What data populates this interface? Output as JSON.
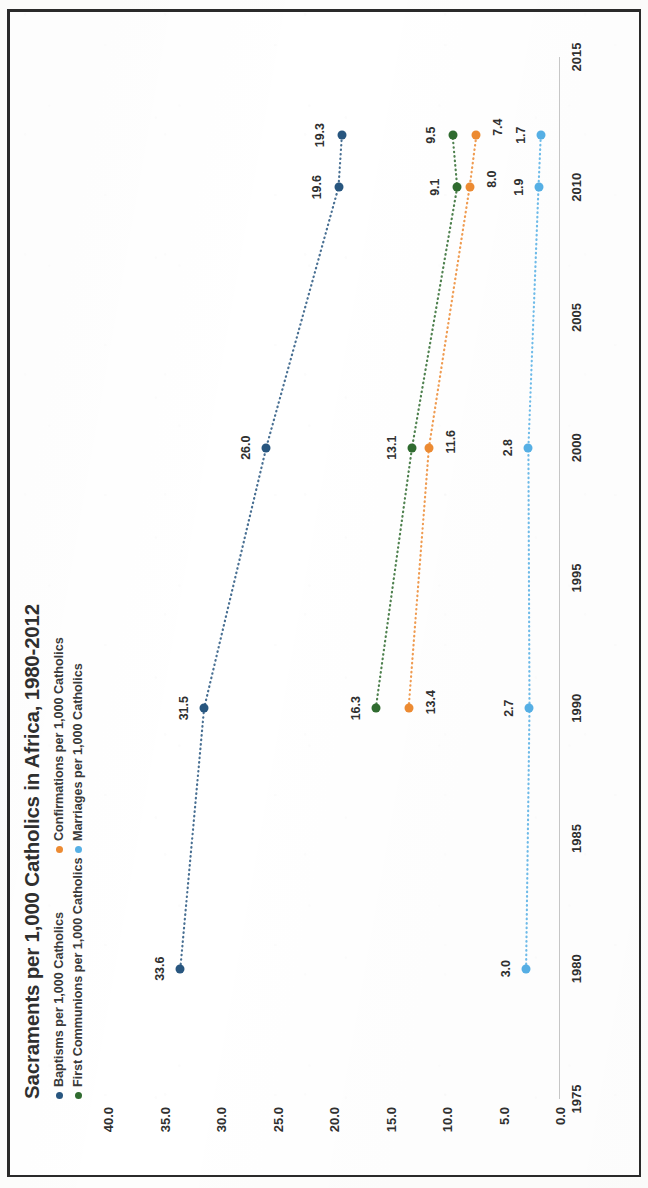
{
  "figure": {
    "title": "Sacraments per 1,000 Catholics in Africa, 1980-2012"
  },
  "legend": [
    {
      "label": "Baptisms per 1,000 Catholics",
      "color": "#28567f",
      "key": "baptisms"
    },
    {
      "label": "First Communions per 1,000 Catholics",
      "color": "#2f6b2f",
      "key": "first_communions"
    },
    {
      "label": "Confirmations per 1,000 Catholics",
      "color": "#ed8b32",
      "key": "confirmations"
    },
    {
      "label": "Marriages per 1,000 Catholics",
      "color": "#56b0e6",
      "key": "marriages"
    }
  ],
  "chart_data": {
    "type": "line",
    "title": "Sacraments per 1,000 Catholics in Africa, 1980-2012",
    "xlabel": "",
    "ylabel": "",
    "x": [
      1980,
      1990,
      2000,
      2010,
      2012
    ],
    "xlim": [
      1975,
      2015
    ],
    "ylim": [
      0.0,
      40.0
    ],
    "xticks": [
      "1975",
      "1980",
      "1985",
      "1990",
      "1995",
      "2000",
      "2005",
      "2010",
      "2015"
    ],
    "xtick_values": [
      1975,
      1980,
      1985,
      1990,
      1995,
      2000,
      2005,
      2010,
      2015
    ],
    "yticks": [
      "0.0",
      "5.0",
      "10.0",
      "15.0",
      "20.0",
      "25.0",
      "30.0",
      "35.0",
      "40.0"
    ],
    "ytick_values": [
      0,
      5,
      10,
      15,
      20,
      25,
      30,
      35,
      40
    ],
    "grid": false,
    "legend_position": "top-left",
    "line_style": "dotted",
    "marker": "circle",
    "series": [
      {
        "name": "Baptisms per 1,000 Catholics",
        "color": "#28567f",
        "values": [
          33.6,
          31.5,
          26.0,
          19.6,
          19.3
        ],
        "labels": [
          "33.6",
          "31.5",
          "26.0",
          "19.6",
          "19.3"
        ]
      },
      {
        "name": "First Communions per 1,000 Catholics",
        "color": "#2f6b2f",
        "values": [
          null,
          16.3,
          13.1,
          9.1,
          9.5
        ],
        "labels": [
          "",
          "16.3",
          "13.1",
          "9.1",
          "9.5"
        ]
      },
      {
        "name": "Confirmations per 1,000 Catholics",
        "color": "#ed8b32",
        "values": [
          null,
          13.4,
          11.6,
          8.0,
          7.4
        ],
        "labels": [
          "",
          "13.4",
          "11.6",
          "8.0",
          "7.4"
        ]
      },
      {
        "name": "Marriages per 1,000 Catholics",
        "color": "#56b0e6",
        "values": [
          3.0,
          2.7,
          2.8,
          1.9,
          1.7
        ],
        "labels": [
          "3.0",
          "2.7",
          "2.8",
          "1.9",
          "1.7"
        ]
      }
    ]
  }
}
